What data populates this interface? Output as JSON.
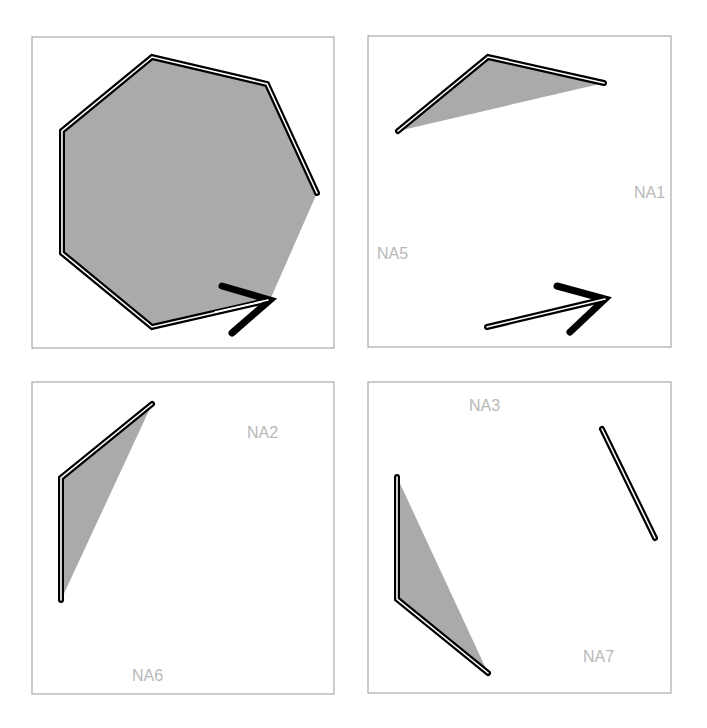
{
  "figure": {
    "colors": {
      "panel_border": "#aaaaaa",
      "fill": "#aaaaaa",
      "line": "#000000",
      "line_core": "#ffffff",
      "label": "#b8b8b8"
    },
    "panels": [
      {
        "id": "panel-1",
        "box": [
          32,
          37,
          302,
          311
        ],
        "fill_polygon": "152,57 267,84 317,193 270,300 152,327 62,253 62,131",
        "path": "270,300 152,327 62,253 62,131 152,57 267,84 317,193",
        "arrow": {
          "tip": [
            270,
            300
          ],
          "arms": "222,286 270,300 232,333"
        },
        "labels": []
      },
      {
        "id": "panel-2",
        "box": [
          368,
          36,
          303,
          311
        ],
        "fill_polygon": "398,131 488,57 604,83",
        "path": "398,131 488,57 604,83",
        "arrow_line": "487,327 605,299",
        "arrow": {
          "tip": [
            605,
            299
          ],
          "arms": "557,286 605,299 570,332"
        },
        "labels": [
          {
            "text": "NA1",
            "x": 634,
            "y": 198
          },
          {
            "text": "NA5",
            "x": 377,
            "y": 259
          }
        ]
      },
      {
        "id": "panel-3",
        "box": [
          32,
          382,
          302,
          312
        ],
        "fill_polygon": "152,404 61,478 61,600",
        "path": "152,404 61,478 61,600",
        "labels": [
          {
            "text": "NA2",
            "x": 247,
            "y": 438
          },
          {
            "text": "NA6",
            "x": 132,
            "y": 681
          }
        ]
      },
      {
        "id": "panel-4",
        "box": [
          368,
          382,
          303,
          311
        ],
        "fill_polygon": "397,477 397,599 488,673",
        "path": "397,477 397,599 488,673",
        "segment": "602,429 655,538",
        "labels": [
          {
            "text": "NA3",
            "x": 469,
            "y": 411
          },
          {
            "text": "NA7",
            "x": 583,
            "y": 662
          }
        ]
      }
    ],
    "label_texts": {
      "na1": "NA1",
      "na2": "NA2",
      "na3": "NA3",
      "na5": "NA5",
      "na6": "NA6",
      "na7": "NA7"
    }
  }
}
